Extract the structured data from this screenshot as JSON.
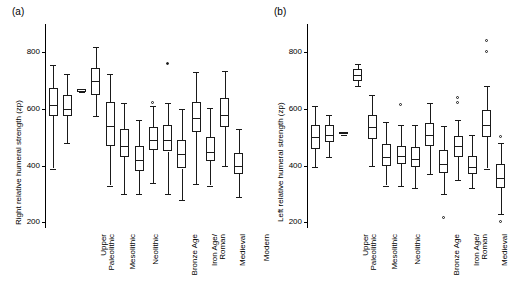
{
  "figure": {
    "panels": [
      {
        "label": "(a)",
        "ylabel": "Right relative humeral strength (zp)"
      },
      {
        "label": "(b)",
        "ylabel": "Left relative humeral strength (zp)"
      }
    ]
  },
  "chart_data": [
    {
      "type": "box",
      "title": "(a)",
      "xlabel": "",
      "ylabel": "Right relative humeral strength (zp)",
      "ylim": [
        180,
        900
      ],
      "yticks": [
        200,
        400,
        600,
        800
      ],
      "grid": false,
      "categories": [
        "Upper\nPaleolithic",
        "Mesolithic",
        "Neolithic",
        "Bronze Age",
        "Iron Age/\nRoman",
        "Medieval",
        "Modern"
      ],
      "groups": [
        {
          "category": "Upper\nPaleolithic",
          "boxes": [
            {
              "whisker_low": 390,
              "q1": 575,
              "median": 615,
              "q3": 675,
              "whisker_high": 755,
              "outliers": []
            },
            {
              "whisker_low": 480,
              "q1": 575,
              "median": 600,
              "q3": 650,
              "whisker_high": 725,
              "outliers": []
            }
          ]
        },
        {
          "category": "Mesolithic",
          "boxes": [
            {
              "whisker_low": 660,
              "q1": 660,
              "median": 665,
              "q3": 670,
              "whisker_high": 670,
              "outliers": []
            },
            {
              "whisker_low": 575,
              "q1": 650,
              "median": 700,
              "q3": 745,
              "whisker_high": 820,
              "outliers": []
            }
          ]
        },
        {
          "category": "Neolithic",
          "boxes": [
            {
              "whisker_low": 330,
              "q1": 470,
              "median": 540,
              "q3": 625,
              "whisker_high": 725,
              "outliers": []
            },
            {
              "whisker_low": 300,
              "q1": 430,
              "median": 470,
              "q3": 530,
              "whisker_high": 620,
              "outliers": []
            }
          ]
        },
        {
          "category": "Bronze Age",
          "boxes": [
            {
              "whisker_low": 300,
              "q1": 380,
              "median": 420,
              "q3": 470,
              "whisker_high": 560,
              "outliers": []
            },
            {
              "whisker_low": 340,
              "q1": 455,
              "median": 490,
              "q3": 535,
              "whisker_high": 610,
              "outliers": [
                620
              ]
            }
          ]
        },
        {
          "category": "Iron Age/\nRoman",
          "boxes": [
            {
              "whisker_low": 300,
              "q1": 450,
              "median": 490,
              "q3": 545,
              "whisker_high": 620,
              "outliers": [
                760
              ]
            },
            {
              "whisker_low": 280,
              "q1": 390,
              "median": 440,
              "q3": 490,
              "whisker_high": 600,
              "outliers": []
            }
          ]
        },
        {
          "category": "Medieval",
          "boxes": [
            {
              "whisker_low": 335,
              "q1": 520,
              "median": 570,
              "q3": 625,
              "whisker_high": 730,
              "outliers": []
            },
            {
              "whisker_low": 330,
              "q1": 415,
              "median": 450,
              "q3": 500,
              "whisker_high": 605,
              "outliers": []
            }
          ]
        },
        {
          "category": "Modern",
          "boxes": [
            {
              "whisker_low": 400,
              "q1": 535,
              "median": 580,
              "q3": 640,
              "whisker_high": 735,
              "outliers": []
            },
            {
              "whisker_low": 290,
              "q1": 370,
              "median": 400,
              "q3": 445,
              "whisker_high": 530,
              "outliers": []
            }
          ]
        }
      ]
    },
    {
      "type": "box",
      "title": "(b)",
      "xlabel": "",
      "ylabel": "Left relative humeral strength (zp)",
      "ylim": [
        180,
        900
      ],
      "yticks": [
        200,
        400,
        600,
        800
      ],
      "grid": false,
      "categories": [
        "Upper\nPaleolithic",
        "Mesolithic",
        "Neolithic",
        "Bronze Age",
        "Iron Age/\nRoman",
        "Medieval",
        "Modern"
      ],
      "groups": [
        {
          "category": "Upper\nPaleolithic",
          "boxes": [
            {
              "whisker_low": 395,
              "q1": 460,
              "median": 500,
              "q3": 545,
              "whisker_high": 610,
              "outliers": []
            },
            {
              "whisker_low": 430,
              "q1": 485,
              "median": 510,
              "q3": 545,
              "whisker_high": 580,
              "outliers": []
            }
          ]
        },
        {
          "category": "Mesolithic",
          "boxes": [
            {
              "whisker_low": 510,
              "q1": 510,
              "median": 515,
              "q3": 520,
              "whisker_high": 520,
              "outliers": []
            },
            {
              "whisker_low": 680,
              "q1": 700,
              "median": 720,
              "q3": 740,
              "whisker_high": 760,
              "outliers": []
            }
          ]
        },
        {
          "category": "Neolithic",
          "boxes": [
            {
              "whisker_low": 400,
              "q1": 495,
              "median": 535,
              "q3": 580,
              "whisker_high": 650,
              "outliers": []
            },
            {
              "whisker_low": 330,
              "q1": 400,
              "median": 430,
              "q3": 475,
              "whisker_high": 555,
              "outliers": []
            }
          ]
        },
        {
          "category": "Bronze Age",
          "boxes": [
            {
              "whisker_low": 330,
              "q1": 405,
              "median": 435,
              "q3": 470,
              "whisker_high": 545,
              "outliers": [
                615
              ]
            },
            {
              "whisker_low": 320,
              "q1": 395,
              "median": 425,
              "q3": 465,
              "whisker_high": 545,
              "outliers": []
            }
          ]
        },
        {
          "category": "Iron Age/\nRoman",
          "boxes": [
            {
              "whisker_low": 370,
              "q1": 470,
              "median": 510,
              "q3": 550,
              "whisker_high": 620,
              "outliers": []
            },
            {
              "whisker_low": 300,
              "q1": 375,
              "median": 405,
              "q3": 455,
              "whisker_high": 540,
              "outliers": [
                215
              ]
            }
          ]
        },
        {
          "category": "Medieval",
          "boxes": [
            {
              "whisker_low": 350,
              "q1": 430,
              "median": 470,
              "q3": 505,
              "whisker_high": 560,
              "outliers": [
                620,
                640
              ]
            },
            {
              "whisker_low": 320,
              "q1": 370,
              "median": 395,
              "q3": 435,
              "whisker_high": 510,
              "outliers": []
            }
          ]
        },
        {
          "category": "Modern",
          "boxes": [
            {
              "whisker_low": 390,
              "q1": 500,
              "median": 545,
              "q3": 595,
              "whisker_high": 680,
              "outliers": [
                800,
                840
              ]
            },
            {
              "whisker_low": 230,
              "q1": 320,
              "median": 355,
              "q3": 405,
              "whisker_high": 480,
              "outliers": [
                200,
                500
              ]
            }
          ]
        }
      ]
    }
  ]
}
